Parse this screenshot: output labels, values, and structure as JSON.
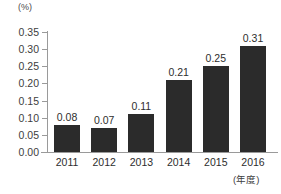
{
  "chart_data": {
    "type": "bar",
    "title": "",
    "subtitle": "",
    "xlabel": "(年度)",
    "ylabel": "(%)",
    "unit_label": "(%)",
    "x_unit_label": "(年度)",
    "categories": [
      "2011",
      "2012",
      "2013",
      "2014",
      "2015",
      "2016"
    ],
    "values": [
      0.08,
      0.07,
      0.11,
      0.21,
      0.25,
      0.31
    ],
    "value_labels": [
      "0.08",
      "0.07",
      "0.11",
      "0.21",
      "0.25",
      "0.31"
    ],
    "series": [
      {
        "name": "",
        "values": [
          0.08,
          0.07,
          0.11,
          0.21,
          0.25,
          0.31
        ]
      }
    ],
    "ylim": [
      0.0,
      0.35
    ],
    "ytick_values": [
      0.35,
      0.3,
      0.25,
      0.2,
      0.15,
      0.1,
      0.05,
      0.0
    ],
    "ytick_labels": [
      "0.35",
      "0.30",
      "0.25",
      "0.20",
      "0.15",
      "0.10",
      "0.05",
      "0.00"
    ],
    "grid": false,
    "legend": false,
    "legend_position": "none",
    "bar_color": "#2b2b2b",
    "axis_color": "#9a9a9a",
    "text_color": "#2d2d2d",
    "background_color": "#ffffff"
  }
}
